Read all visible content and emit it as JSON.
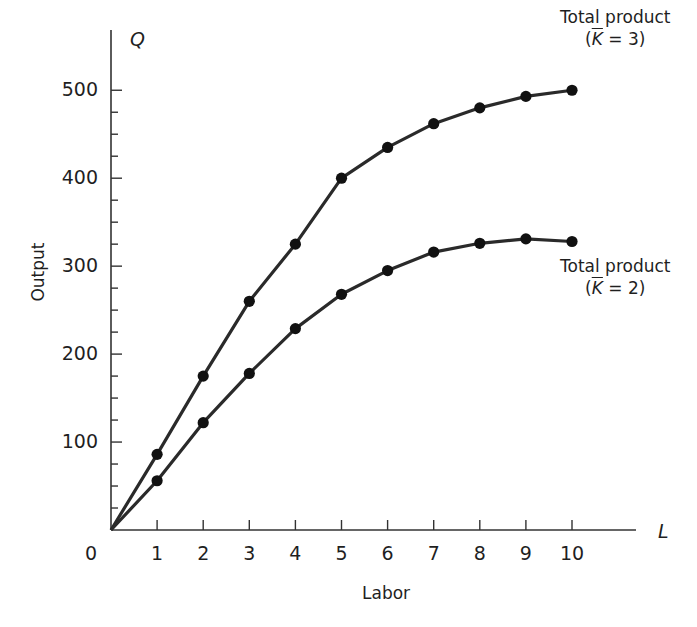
{
  "chart_data": {
    "type": "line",
    "title": "",
    "xlabel": "Labor",
    "ylabel": "Output",
    "x_axis_symbol": "L",
    "y_axis_symbol": "Q",
    "x": [
      0,
      1,
      2,
      3,
      4,
      5,
      6,
      7,
      8,
      9,
      10
    ],
    "xlim": [
      0,
      11.3
    ],
    "ylim": [
      0,
      560
    ],
    "x_ticks": [
      "0",
      "1",
      "2",
      "3",
      "4",
      "5",
      "6",
      "7",
      "8",
      "9",
      "10"
    ],
    "y_ticks": [
      "100",
      "200",
      "300",
      "400",
      "500"
    ],
    "y_minor_tick_step": 25,
    "grid": false,
    "markers": true,
    "series": [
      {
        "name": "Total product (K = 3)",
        "label_line1": "Total product",
        "label_k": "K",
        "label_rest": " = 3)",
        "values": [
          0,
          86,
          175,
          260,
          325,
          400,
          435,
          462,
          480,
          493,
          500
        ]
      },
      {
        "name": "Total product (K = 2)",
        "label_line1": "Total product",
        "label_k": "K",
        "label_rest": " = 2)",
        "values": [
          0,
          56,
          122,
          178,
          229,
          268,
          295,
          316,
          326,
          331,
          328
        ]
      }
    ],
    "colors": {
      "line": "#2a2a2a",
      "marker": "#111111",
      "axis": "#333333"
    }
  }
}
